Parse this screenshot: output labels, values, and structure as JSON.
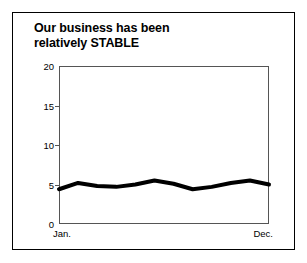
{
  "chart_data": {
    "type": "line",
    "title": "Our business has been relatively STABLE",
    "title_lines": [
      "Our business has been",
      "relatively STABLE"
    ],
    "xlabel": "",
    "ylabel": "",
    "ylim": [
      0,
      20
    ],
    "yticks": [
      0,
      5,
      10,
      15,
      20
    ],
    "ytick_labels": [
      "0",
      "5",
      "10",
      "15",
      "20"
    ],
    "xtick_labels": [
      "Jan.",
      "Dec."
    ],
    "grid": false,
    "legend": null,
    "x": [
      "Jan.",
      "Feb.",
      "Mar.",
      "Apr.",
      "May",
      "Jun.",
      "Jul.",
      "Aug.",
      "Sep.",
      "Oct.",
      "Nov.",
      "Dec."
    ],
    "categories": [
      "Jan.",
      "Feb.",
      "Mar.",
      "Apr.",
      "May",
      "Jun.",
      "Jul.",
      "Aug.",
      "Sep.",
      "Oct.",
      "Nov.",
      "Dec."
    ],
    "values": [
      4.4,
      5.2,
      4.8,
      4.7,
      5.0,
      5.5,
      5.1,
      4.4,
      4.7,
      5.2,
      5.5,
      5.0
    ],
    "series": [
      {
        "name": "Business",
        "values": [
          4.4,
          5.2,
          4.8,
          4.7,
          5.0,
          5.5,
          5.1,
          4.4,
          4.7,
          5.2,
          5.5,
          5.0
        ],
        "color": "#000000",
        "line_width": 4
      }
    ],
    "colors": {
      "line": "#000000",
      "axis": "#555555",
      "frame": "#000000",
      "background": "#ffffff",
      "text": "#000000"
    }
  }
}
